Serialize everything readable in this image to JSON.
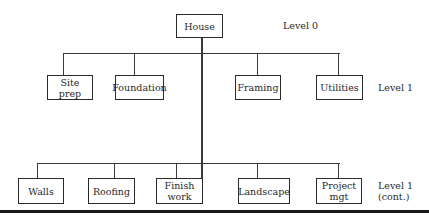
{
  "diagram": {
    "type": "hierarchy / work breakdown structure",
    "root": {
      "label": "House",
      "level_label": "Level 0"
    },
    "level1_row1": {
      "level_label": "Level 1",
      "nodes": [
        {
          "label": "Site prep"
        },
        {
          "label": "Foundation"
        },
        {
          "label": "Framing"
        },
        {
          "label": "Utilities"
        }
      ]
    },
    "level1_row2": {
      "level_label": "Level 1\n(cont.)",
      "nodes": [
        {
          "label": "Walls"
        },
        {
          "label": "Roofing"
        },
        {
          "label": "Finish\nwork"
        },
        {
          "label": "Landscape"
        },
        {
          "label": "Project\nmgt"
        }
      ]
    }
  },
  "colors": {
    "line": "#3a3a3a",
    "box_border": "#2a2a2a",
    "background": "#ffffff"
  }
}
